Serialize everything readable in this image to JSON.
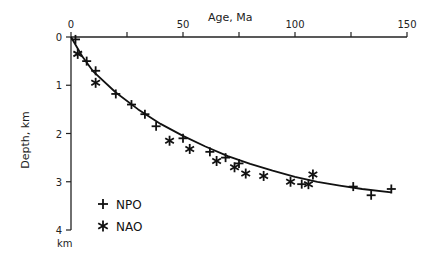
{
  "chart_data": {
    "type": "scatter",
    "title": "",
    "xlabel": "Age, Ma",
    "ylabel": "Depth, km",
    "y_unit_label": "km",
    "xlim": [
      0,
      150
    ],
    "ylim": [
      0,
      4
    ],
    "y_inverted": true,
    "x_axis_position": "top",
    "x_ticks": [
      0,
      25,
      50,
      75,
      100,
      125,
      150
    ],
    "x_tick_labels": [
      "0",
      "",
      "50",
      "",
      "100",
      "",
      "150"
    ],
    "y_ticks": [
      0,
      1,
      2,
      3,
      4
    ],
    "y_tick_labels": [
      "0",
      "1",
      "2",
      "3",
      "4"
    ],
    "grid": false,
    "legend_position": "lower-left",
    "series": [
      {
        "name": "NPO",
        "marker": "plus",
        "points": [
          [
            2,
            0.05
          ],
          [
            7,
            0.5
          ],
          [
            11,
            0.7
          ],
          [
            20,
            1.18
          ],
          [
            27,
            1.4
          ],
          [
            33,
            1.6
          ],
          [
            38,
            1.85
          ],
          [
            50,
            2.1
          ],
          [
            62,
            2.38
          ],
          [
            69,
            2.5
          ],
          [
            75,
            2.62
          ],
          [
            103,
            3.05
          ],
          [
            126,
            3.1
          ],
          [
            134,
            3.28
          ],
          [
            143,
            3.15
          ]
        ]
      },
      {
        "name": "NAO",
        "marker": "asterisk",
        "points": [
          [
            3,
            0.35
          ],
          [
            11,
            0.95
          ],
          [
            44,
            2.15
          ],
          [
            53,
            2.32
          ],
          [
            65,
            2.57
          ],
          [
            73,
            2.7
          ],
          [
            78,
            2.83
          ],
          [
            86,
            2.88
          ],
          [
            98,
            3.0
          ],
          [
            106,
            3.05
          ],
          [
            108,
            2.85
          ]
        ]
      },
      {
        "name": "fit",
        "type": "line",
        "formula": "depth ~ 0.265*sqrt(age) approx, flattening at old ages",
        "points": [
          [
            0,
            0
          ],
          [
            5,
            0.4
          ],
          [
            10,
            0.72
          ],
          [
            20,
            1.15
          ],
          [
            30,
            1.5
          ],
          [
            40,
            1.8
          ],
          [
            50,
            2.05
          ],
          [
            60,
            2.27
          ],
          [
            70,
            2.47
          ],
          [
            80,
            2.63
          ],
          [
            90,
            2.77
          ],
          [
            100,
            2.9
          ],
          [
            110,
            3.0
          ],
          [
            120,
            3.08
          ],
          [
            130,
            3.15
          ],
          [
            143,
            3.22
          ]
        ]
      }
    ]
  },
  "legend": [
    {
      "symbol": "+",
      "label": "NPO"
    },
    {
      "symbol": "*",
      "label": "NAO"
    }
  ]
}
